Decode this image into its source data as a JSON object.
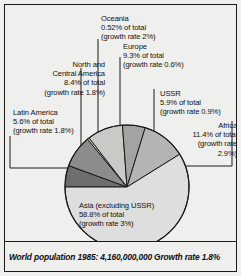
{
  "caption": {
    "text": "World population 1985: 4,160,000,000 Growth rate 1.8%"
  },
  "labels": {
    "oceania": "Oceania\n0.52% of total\n(growth rate 2%)",
    "europe": "Europe\n9.3% of total\n(growth rate 0.6%)",
    "north_central_america": "North and\nCentral America\n8.4% of total\n(growth rate 1.8%)",
    "ussr": "USSR\n5.9% of total\n(growth rate 0.9%)",
    "latin_america": "Latin America\n5.6% of total\n(growth rate 1.8%)",
    "africa": "Africa\n11.4% of total\n(growth rate\n2.9%)",
    "asia": "Asia (excluding USSR)\n58.8% of total\n(growth rate 3%)"
  },
  "chart_data": {
    "type": "pie",
    "title": "World population 1985: 4,160,000,000 Growth rate 1.8%",
    "total_population": "4,160,000,000",
    "year": 1985,
    "world_growth_rate": "1.8%",
    "legend_position": "callout-labels",
    "start_angle_deg": 180,
    "direction": "clockwise",
    "categories": [
      "Latin America",
      "North and Central America",
      "Oceania",
      "Europe",
      "USSR",
      "Africa",
      "Asia (excluding USSR)"
    ],
    "values": [
      5.6,
      8.4,
      0.52,
      9.3,
      5.9,
      11.4,
      58.8
    ],
    "value_labels": [
      "5.6%",
      "8.4%",
      "0.52%",
      "9.3%",
      "5.9%",
      "11.4%",
      "58.8%"
    ],
    "growth_rates": [
      "1.8%",
      "1.8%",
      "2%",
      "0.6%",
      "0.9%",
      "2.9%",
      "3%"
    ],
    "colors": [
      "#6e6e6e",
      "#8c8c8c",
      "#d4d4d2",
      "#c9c9c6",
      "#a3a3a1",
      "#b4b4b2",
      "#dedede"
    ],
    "slice_stroke": "#1a1a1a",
    "units": "percent of total world population"
  },
  "geometry": {
    "center_x": 122,
    "center_y": 182,
    "radius": 62
  }
}
